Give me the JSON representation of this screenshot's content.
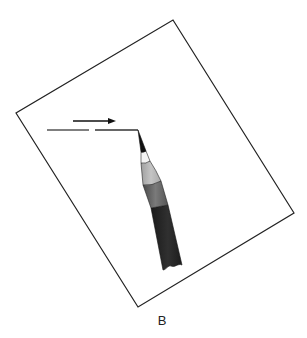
{
  "figure": {
    "label": "B",
    "colors": {
      "outline": "#222222",
      "pencil_tip": "#111111",
      "pencil_wood_light": "#f2f2f2",
      "pencil_cone": "#b5b5b5",
      "pencil_band": "#6e6e6e",
      "pencil_body": "#262626"
    }
  }
}
